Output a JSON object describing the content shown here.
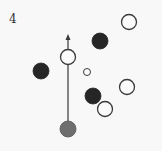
{
  "diagram": {
    "label": "4",
    "colors": {
      "background": "#f8f8f8",
      "stroke": "#3a3a3a",
      "dark_fill": "#262626",
      "gray_fill": "#6e6e6e",
      "hollow_fill": "#fbfbfb"
    },
    "arrow": {
      "x": 68,
      "y_start": 129,
      "y_end": 34
    },
    "circles": [
      {
        "id": "gray-start",
        "type": "gray",
        "cx": 68,
        "cy": 129,
        "r": 8
      },
      {
        "id": "hollow-on-path",
        "type": "hollow",
        "cx": 68,
        "cy": 57,
        "r": 7.5
      },
      {
        "id": "dark-left",
        "type": "dark",
        "cx": 41,
        "cy": 71,
        "r": 8
      },
      {
        "id": "dark-top",
        "type": "dark",
        "cx": 100,
        "cy": 41,
        "r": 8
      },
      {
        "id": "hollow-top-right",
        "type": "hollow",
        "cx": 129,
        "cy": 22,
        "r": 7.5
      },
      {
        "id": "hollow-small-center",
        "type": "hollow",
        "cx": 87,
        "cy": 72,
        "r": 3.5
      },
      {
        "id": "hollow-right",
        "type": "hollow",
        "cx": 127,
        "cy": 87,
        "r": 7.5
      },
      {
        "id": "dark-center",
        "type": "dark",
        "cx": 93,
        "cy": 96,
        "r": 8
      },
      {
        "id": "hollow-bottom",
        "type": "hollow",
        "cx": 105,
        "cy": 109,
        "r": 7.5
      }
    ]
  }
}
